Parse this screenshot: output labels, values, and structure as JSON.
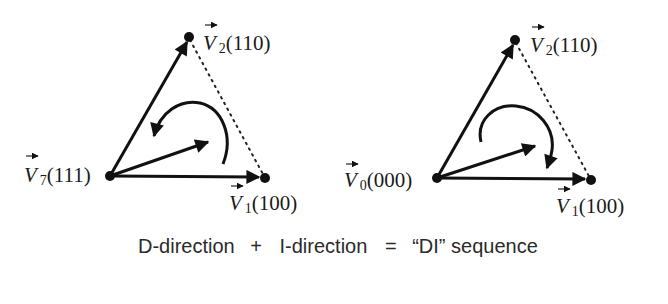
{
  "diagrams": [
    {
      "id": "left",
      "origin": {
        "name": "V",
        "sub": "7",
        "code": "(111)",
        "x": 110,
        "y": 176
      },
      "v2": {
        "name": "V",
        "sub": "2",
        "code": "(110)",
        "x": 189,
        "y": 37
      },
      "v1": {
        "name": "V",
        "sub": "1",
        "code": "(100)",
        "x": 265,
        "y": 178
      },
      "rotation": "counter-clockwise"
    },
    {
      "id": "right",
      "origin": {
        "name": "V",
        "sub": "0",
        "code": "(000)",
        "x": 437,
        "y": 178
      },
      "v2": {
        "name": "V",
        "sub": "2",
        "code": "(110)",
        "x": 515,
        "y": 40
      },
      "v1": {
        "name": "V",
        "sub": "1",
        "code": "(100)",
        "x": 591,
        "y": 180
      },
      "rotation": "clockwise"
    }
  ],
  "caption": {
    "part1": "D-direction",
    "plus": "+",
    "part2": "I-direction",
    "equals": "=",
    "result": "“DI” sequence"
  },
  "colors": {
    "line": "#111111",
    "text": "#1a1a1a"
  }
}
